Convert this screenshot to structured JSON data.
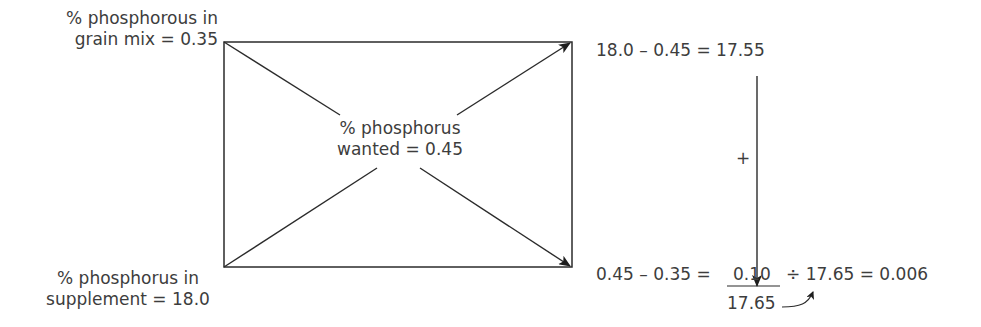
{
  "corners": {
    "top_left": {
      "line1": "% phosphorous in",
      "line2": "grain mix = 0.35"
    },
    "bottom_left": {
      "line1": "% phosphorus in",
      "line2": "supplement = 18.0"
    }
  },
  "center": {
    "line1": "% phosphorus",
    "line2": "wanted  = 0.45"
  },
  "right": {
    "top_equation": "18.0 – 0.45 = 17.55",
    "plus_sign": "+",
    "bottom_equation_left": "0.45 – 0.35 =",
    "fraction_numerator": "0.10",
    "fraction_denominator": "17.65",
    "bottom_equation_right": "÷ 17.65 = 0.006"
  },
  "colors": {
    "line": "#2b2b2b",
    "text": "#3d3d3d"
  }
}
